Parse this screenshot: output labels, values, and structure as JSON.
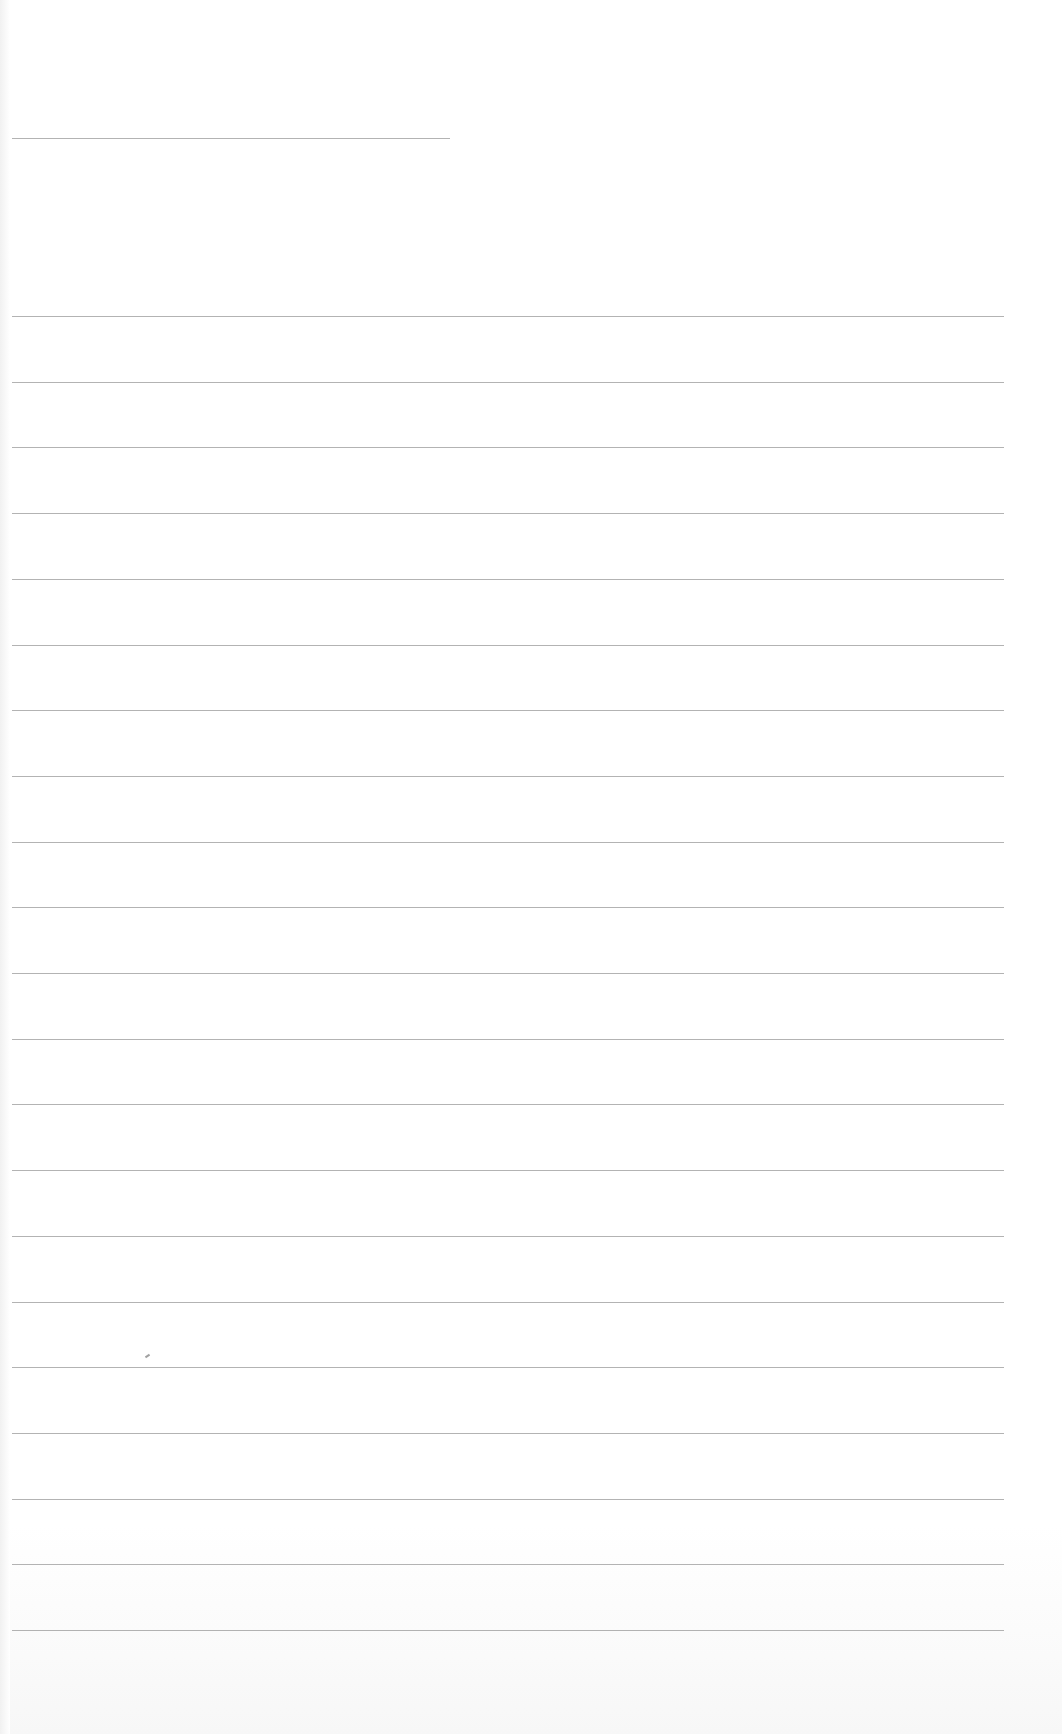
{
  "page": {
    "type": "ruled-notebook-page",
    "background_color": "#ffffff",
    "rule_color": "#9a9a9a",
    "text_content": ""
  },
  "header_rule": {
    "x": 12,
    "y": 138,
    "width": 438
  },
  "rules": {
    "x": 12,
    "width": 992,
    "start_y": 316,
    "spacing": 65.7,
    "count": 21
  },
  "stray_mark": {
    "x": 145,
    "y": 1355
  }
}
